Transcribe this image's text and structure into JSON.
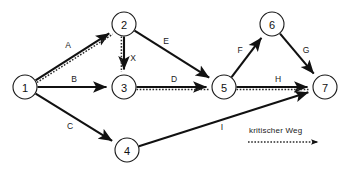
{
  "diagram": {
    "type": "network-diagram",
    "colors": {
      "node_stroke": "#1a1a1a",
      "node_fill": "#ffffff",
      "edge": "#111111",
      "critical_path": "#2b2b2b",
      "background": "#ffffff"
    },
    "nodes": [
      {
        "id": "1",
        "label": "1",
        "x": 25,
        "y": 87,
        "r": 12
      },
      {
        "id": "2",
        "label": "2",
        "x": 124,
        "y": 24,
        "r": 12
      },
      {
        "id": "3",
        "label": "3",
        "x": 124,
        "y": 87,
        "r": 12
      },
      {
        "id": "4",
        "label": "4",
        "x": 127,
        "y": 150,
        "r": 12
      },
      {
        "id": "5",
        "label": "5",
        "x": 224,
        "y": 87,
        "r": 12
      },
      {
        "id": "6",
        "label": "6",
        "x": 272,
        "y": 24,
        "r": 12
      },
      {
        "id": "7",
        "label": "7",
        "x": 325,
        "y": 87,
        "r": 12
      }
    ],
    "edges": [
      {
        "id": "A",
        "label": "A",
        "from": "1",
        "to": "2",
        "critical": true,
        "label_x": 68,
        "label_y": 45
      },
      {
        "id": "B",
        "label": "B",
        "from": "1",
        "to": "3",
        "critical": false,
        "label_x": 74,
        "label_y": 79
      },
      {
        "id": "C",
        "label": "C",
        "from": "1",
        "to": "4",
        "critical": false,
        "label_x": 70,
        "label_y": 126
      },
      {
        "id": "X",
        "label": "X",
        "from": "2",
        "to": "3",
        "critical": true,
        "label_x": 133,
        "label_y": 58
      },
      {
        "id": "E",
        "label": "E",
        "from": "2",
        "to": "5",
        "critical": false,
        "label_x": 166,
        "label_y": 41
      },
      {
        "id": "D",
        "label": "D",
        "from": "3",
        "to": "5",
        "critical": true,
        "label_x": 174,
        "label_y": 79
      },
      {
        "id": "F",
        "label": "F",
        "from": "5",
        "to": "6",
        "critical": false,
        "label_x": 240,
        "label_y": 50
      },
      {
        "id": "G",
        "label": "G",
        "from": "6",
        "to": "7",
        "critical": false,
        "label_x": 306,
        "label_y": 50
      },
      {
        "id": "H",
        "label": "H",
        "from": "5",
        "to": "7",
        "critical": true,
        "label_x": 278,
        "label_y": 79
      },
      {
        "id": "I",
        "label": "I",
        "from": "4",
        "to": "7",
        "critical": false,
        "label_x": 222,
        "label_y": 127
      }
    ],
    "legend": {
      "label": "kritischer Weg",
      "label_x": 249,
      "label_y": 133,
      "line_x1": 248,
      "line_x2": 318,
      "line_y": 142
    }
  }
}
